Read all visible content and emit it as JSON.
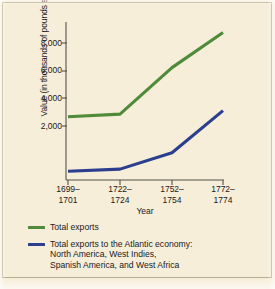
{
  "chart_data": {
    "type": "line",
    "title": "",
    "xlabel": "Year",
    "ylabel": "Value (in thousands of pounds sterling)",
    "categories": [
      "1699–\n1701",
      "1722–\n1724",
      "1752–\n1754",
      "1772–\n1774"
    ],
    "category_lines": [
      {
        "line1": "1699–",
        "line2": "1701"
      },
      {
        "line1": "1722–",
        "line2": "1724"
      },
      {
        "line1": "1752–",
        "line2": "1754"
      },
      {
        "line1": "1772–",
        "line2": "1774"
      }
    ],
    "ylim": [
      0,
      9000
    ],
    "yticks": [
      2000,
      4000,
      6000,
      8000
    ],
    "ytick_labels": [
      "2,000",
      "4,000",
      "6,000",
      "8,000"
    ],
    "grid": false,
    "legend_position": "below",
    "series": [
      {
        "name": "Total exports",
        "color": "#4f8b3b",
        "values": [
          3600,
          3750,
          6400,
          8400
        ]
      },
      {
        "name": "Total exports to the Atlantic economy: North America, West Indies, Spanish America, and West Africa",
        "color": "#2c3f8f",
        "values": [
          500,
          620,
          1550,
          3950
        ]
      }
    ]
  },
  "axes": {
    "y_title": "Value (in thousands of pounds sterling)",
    "x_title": "Year",
    "ytick_labels": [
      "8,000",
      "6,000",
      "4,000",
      "2,000"
    ],
    "xtick_labels": [
      {
        "line1": "1699–",
        "line2": "1701"
      },
      {
        "line1": "1722–",
        "line2": "1724"
      },
      {
        "line1": "1752–",
        "line2": "1754"
      },
      {
        "line1": "1772–",
        "line2": "1774"
      }
    ]
  },
  "legend": {
    "entries": [
      {
        "color": "#4f8b3b",
        "lines": [
          "Total exports"
        ]
      },
      {
        "color": "#2c3f8f",
        "lines": [
          "Total exports to the Atlantic economy:",
          "North America, West Indies,",
          "Spanish America, and West Africa"
        ]
      }
    ]
  },
  "colors": {
    "background": "#f6eed9",
    "axis": "#55504a",
    "text": "#22201c",
    "green_series": "#4f8b3b",
    "blue_series": "#2c3f8f",
    "frame": "#b9ad90"
  }
}
